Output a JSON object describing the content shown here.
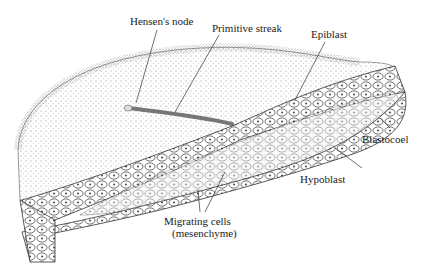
{
  "diagram": {
    "labels": {
      "hensens_node": "Hensen's node",
      "primitive_streak": "Primitive streak",
      "epiblast": "Epiblast",
      "blastocoel": "Blastocoel",
      "hypoblast": "Hypoblast",
      "migrating_cells_1": "Migrating cells",
      "migrating_cells_2": "(mesenchyme)"
    },
    "colors": {
      "ink": "#222222",
      "stipple": "#555555",
      "background": "#ffffff"
    }
  }
}
